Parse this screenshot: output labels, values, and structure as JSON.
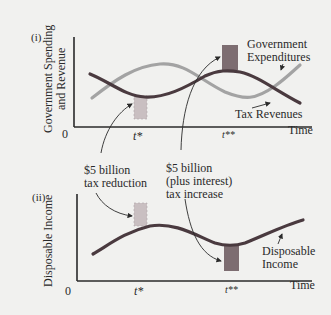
{
  "panels": [
    {
      "id": "(i)",
      "ylabel_line1": "Government Spending",
      "ylabel_line2": "and Revenue",
      "origin": "0",
      "xlabel": "Time",
      "tick_t1": "t*",
      "tick_t2": "t**",
      "series": [
        {
          "name": "Government Expenditures",
          "label_line1": "Government",
          "label_line2": "Expenditures",
          "color": "#9c9c9c"
        },
        {
          "name": "Tax Revenues",
          "label": "Tax Revenues",
          "color": "#4a3a3f"
        }
      ]
    },
    {
      "id": "(ii)",
      "ylabel": "Disposable Income",
      "origin": "0",
      "xlabel": "Time",
      "tick_t1": "t*",
      "tick_t2": "t**",
      "series": [
        {
          "name": "Disposable Income",
          "label_line1": "Disposable",
          "label_line2": "Income",
          "color": "#4a3a3f"
        }
      ]
    }
  ],
  "annotations": {
    "tax_reduction_line1": "$5 billion",
    "tax_reduction_line2": "tax reduction",
    "tax_increase_line1": "$5 billion",
    "tax_increase_line2": "(plus interest)",
    "tax_increase_line3": "tax increase"
  },
  "colors": {
    "background": "#f1f1ef",
    "axis": "#2a2a2a",
    "dark_curve": "#4a3a3f",
    "light_curve": "#a0a0a0",
    "bar_light": "#c6bcbe",
    "bar_dark": "#7a6a6e"
  }
}
